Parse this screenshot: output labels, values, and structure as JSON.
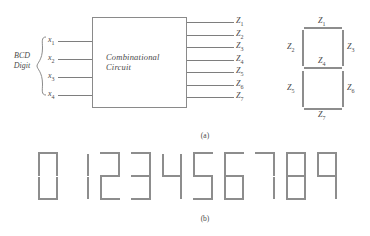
{
  "figure": {
    "caption_a": "(a)",
    "caption_b": "(b)"
  },
  "block_diagram": {
    "block_label_line1": "Combinational",
    "block_label_line2": "Circuit",
    "input_group_label_line1": "BCD",
    "input_group_label_line2": "Digit",
    "inputs": [
      {
        "name": "x",
        "sub": "1"
      },
      {
        "name": "x",
        "sub": "2"
      },
      {
        "name": "x",
        "sub": "3"
      },
      {
        "name": "x",
        "sub": "4"
      }
    ],
    "outputs": [
      {
        "name": "Z",
        "sub": "1"
      },
      {
        "name": "Z",
        "sub": "2"
      },
      {
        "name": "Z",
        "sub": "3"
      },
      {
        "name": "Z",
        "sub": "4"
      },
      {
        "name": "Z",
        "sub": "5"
      },
      {
        "name": "Z",
        "sub": "6"
      },
      {
        "name": "Z",
        "sub": "7"
      }
    ]
  },
  "segment_legend": {
    "description": "seven-segment display with each segment labelled",
    "labels": {
      "top": {
        "name": "Z",
        "sub": "1"
      },
      "upper_left": {
        "name": "Z",
        "sub": "2"
      },
      "upper_right": {
        "name": "Z",
        "sub": "3"
      },
      "middle": {
        "name": "Z",
        "sub": "4"
      },
      "lower_left": {
        "name": "Z",
        "sub": "5"
      },
      "lower_right": {
        "name": "Z",
        "sub": "6"
      },
      "bottom": {
        "name": "Z",
        "sub": "7"
      }
    }
  },
  "digit_row": {
    "segment_order": [
      "top",
      "upper_left",
      "upper_right",
      "middle",
      "lower_left",
      "lower_right",
      "bottom"
    ],
    "digits": [
      {
        "value": "0",
        "segments": [
          1,
          1,
          1,
          0,
          1,
          1,
          1
        ]
      },
      {
        "value": "1",
        "segments": [
          0,
          0,
          1,
          0,
          0,
          1,
          0
        ]
      },
      {
        "value": "2",
        "segments": [
          1,
          0,
          1,
          1,
          1,
          0,
          1
        ]
      },
      {
        "value": "3",
        "segments": [
          1,
          0,
          1,
          1,
          0,
          1,
          1
        ]
      },
      {
        "value": "4",
        "segments": [
          0,
          1,
          1,
          1,
          0,
          1,
          0
        ]
      },
      {
        "value": "5",
        "segments": [
          1,
          1,
          0,
          1,
          0,
          1,
          1
        ]
      },
      {
        "value": "6",
        "segments": [
          1,
          1,
          0,
          1,
          1,
          1,
          1
        ]
      },
      {
        "value": "7",
        "segments": [
          1,
          0,
          1,
          0,
          0,
          1,
          0
        ]
      },
      {
        "value": "8",
        "segments": [
          1,
          1,
          1,
          1,
          1,
          1,
          1
        ]
      },
      {
        "value": "9",
        "segments": [
          1,
          1,
          1,
          1,
          0,
          1,
          0
        ]
      }
    ]
  },
  "colors": {
    "ink": "#8d8d8d",
    "text": "#4a4a4a",
    "background": "#ffffff"
  }
}
